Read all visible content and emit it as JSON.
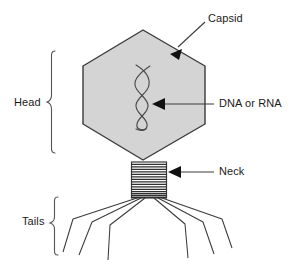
{
  "figure": {
    "background_color": "#ffffff",
    "width": 302,
    "height": 266
  },
  "colors": {
    "stroke": "#333333",
    "capsid_fill": "#d4d4d4",
    "capsid_stroke": "#3a3a3a",
    "text": "#1a1a1a",
    "brace": "#555555",
    "dna_stroke": "#4a4a4a"
  },
  "labels": {
    "capsid": "Capsid",
    "dna_or_rna": "DNA or RNA",
    "neck": "Neck",
    "head": "Head",
    "tails": "Tails"
  },
  "parts": {
    "capsid": {
      "name": "capsid",
      "shape": "hexagon",
      "points": "143,30 205,66 205,124 143,160 83,124 83,66"
    },
    "genome": {
      "name": "dna-or-rna",
      "shape": "double-helix",
      "strands": 2
    },
    "neck": {
      "name": "neck",
      "shape": "ringed-cylinder",
      "ring_count": 15
    },
    "tails": {
      "name": "tail-fibers",
      "shape": "splayed-fibers",
      "fiber_count": 6
    }
  },
  "annotations": [
    {
      "id": "capsid-annotation",
      "label": "Capsid",
      "arrow": "down-left",
      "target": "capsid"
    },
    {
      "id": "dna-annotation",
      "label": "DNA or RNA",
      "arrow": "left",
      "target": "genome"
    },
    {
      "id": "neck-annotation",
      "label": "Neck",
      "arrow": "left",
      "target": "neck"
    },
    {
      "id": "head-brace",
      "label": "Head",
      "brace": "right-facing",
      "target": "capsid"
    },
    {
      "id": "tails-brace",
      "label": "Tails",
      "brace": "right-facing",
      "target": "tails"
    }
  ]
}
